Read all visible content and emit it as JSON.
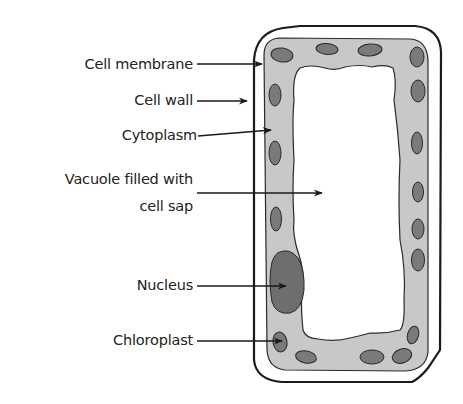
{
  "diagram": {
    "colors": {
      "cytoplasm": "#c8c8c8",
      "organelle": "#7a7a7a",
      "nucleus": "#6e6e6e",
      "outline": "#1a1a1a",
      "vacuole": "#ffffff",
      "text": "#222222"
    },
    "labels": [
      {
        "id": "cell-membrane",
        "text": "Cell membrane"
      },
      {
        "id": "cell-wall",
        "text": "Cell wall"
      },
      {
        "id": "cytoplasm",
        "text": "Cytoplasm"
      },
      {
        "id": "vacuole-line1",
        "text": "Vacuole filled with"
      },
      {
        "id": "vacuole-line2",
        "text": "cell sap"
      },
      {
        "id": "nucleus",
        "text": "Nucleus"
      },
      {
        "id": "chloroplast",
        "text": "Chloroplast"
      }
    ]
  }
}
